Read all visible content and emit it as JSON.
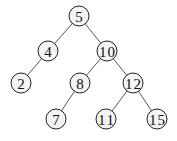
{
  "diagram": {
    "type": "binary-search-tree",
    "nodes": [
      {
        "id": "n5",
        "label": "5",
        "x": 79,
        "y": 16
      },
      {
        "id": "n4",
        "label": "4",
        "x": 48,
        "y": 51
      },
      {
        "id": "n10",
        "label": "10",
        "x": 107,
        "y": 51
      },
      {
        "id": "n2",
        "label": "2",
        "x": 21,
        "y": 83
      },
      {
        "id": "n8",
        "label": "8",
        "x": 80,
        "y": 83
      },
      {
        "id": "n12",
        "label": "12",
        "x": 133,
        "y": 83
      },
      {
        "id": "n7",
        "label": "7",
        "x": 56,
        "y": 119
      },
      {
        "id": "n11",
        "label": "11",
        "x": 106,
        "y": 119
      },
      {
        "id": "n15",
        "label": "15",
        "x": 157,
        "y": 119
      }
    ],
    "edges": [
      [
        "n5",
        "n4"
      ],
      [
        "n5",
        "n10"
      ],
      [
        "n4",
        "n2"
      ],
      [
        "n10",
        "n8"
      ],
      [
        "n10",
        "n12"
      ],
      [
        "n8",
        "n7"
      ],
      [
        "n12",
        "n11"
      ],
      [
        "n12",
        "n15"
      ]
    ]
  }
}
